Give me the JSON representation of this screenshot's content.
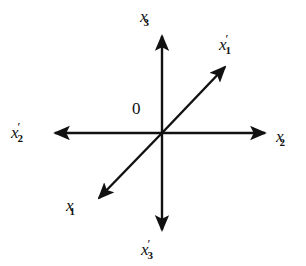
{
  "figure": {
    "type": "coordinate-axes-diagram",
    "background_color": "#ffffff",
    "line_color": "#111111",
    "origin": {
      "label": "0",
      "x": 162,
      "y": 133
    },
    "axes": [
      {
        "name": "x3-axis",
        "label_base": "x",
        "label_prime": "",
        "label_sub": "3",
        "label_text": "x3",
        "direction": "up",
        "angle_deg": 90,
        "arrow_tip": {
          "x": 162,
          "y": 33
        },
        "double_headed": false
      },
      {
        "name": "x3-prime-axis",
        "label_base": "x",
        "label_prime": "′",
        "label_sub": "3",
        "label_text": "x'3",
        "direction": "down",
        "angle_deg": 270,
        "arrow_tip": {
          "x": 162,
          "y": 233
        },
        "double_headed": false
      },
      {
        "name": "x2-axis",
        "label_base": "x",
        "label_prime": "",
        "label_sub": "2",
        "label_text": "x2",
        "direction": "right",
        "angle_deg": 0,
        "arrow_tip": {
          "x": 268,
          "y": 133
        },
        "double_headed": false
      },
      {
        "name": "x2-prime-axis",
        "label_base": "x",
        "label_prime": "′",
        "label_sub": "2",
        "label_text": "x'2",
        "direction": "left",
        "angle_deg": 180,
        "arrow_tip": {
          "x": 52,
          "y": 133
        },
        "double_headed": false
      },
      {
        "name": "x1-prime-axis",
        "label_base": "x",
        "label_prime": "′",
        "label_sub": "1",
        "label_text": "x'1",
        "direction": "upper-right",
        "angle_deg": 40,
        "arrow_tip": {
          "x": 228,
          "y": 64
        },
        "double_headed": false
      },
      {
        "name": "x1-axis",
        "label_base": "x",
        "label_prime": "",
        "label_sub": "1",
        "label_text": "x1",
        "direction": "lower-left",
        "angle_deg": 220,
        "arrow_tip": {
          "x": 96,
          "y": 201
        },
        "double_headed": false
      }
    ]
  }
}
